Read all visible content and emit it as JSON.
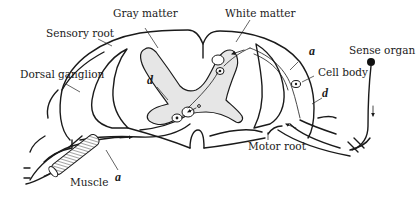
{
  "figure": {
    "labels": {
      "gray_matter": "Gray matter",
      "white_matter": "White matter",
      "sensory_root": "Sensory root",
      "dorsal_ganglion": "Dorsal ganglion",
      "sense_organ": "Sense organ",
      "cell_body": "Cell body",
      "motor_root": "Motor root",
      "muscle": "Muscle",
      "a_right": "a",
      "d_right": "d",
      "d_center": "d",
      "a_bottom": "a"
    },
    "colors": {
      "ink": "#1a1a1a",
      "gray_matter_fill": "#e6e6e6",
      "background": "#ffffff"
    }
  }
}
